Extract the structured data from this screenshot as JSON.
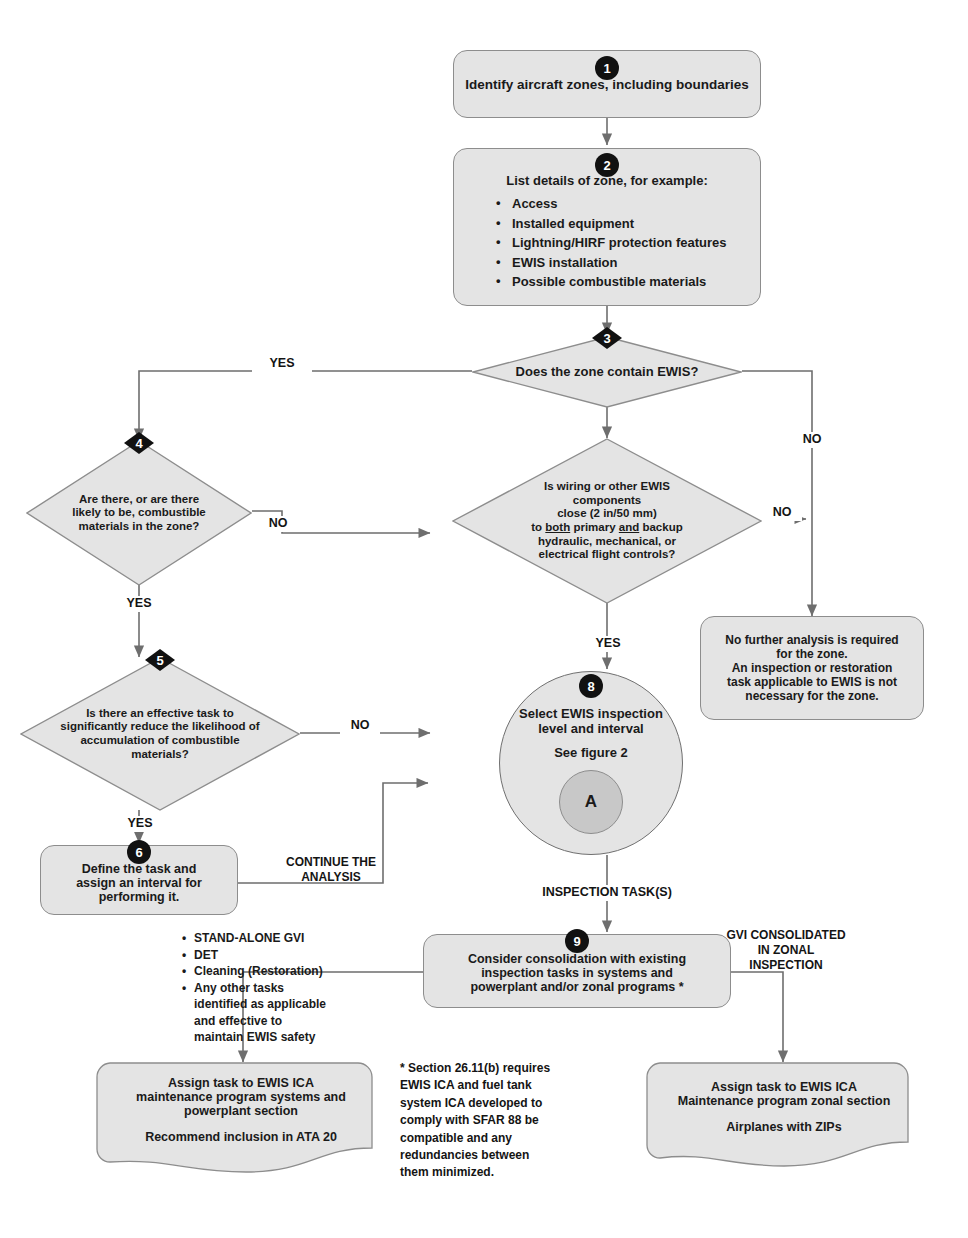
{
  "diagram": {
    "type": "flowchart"
  },
  "nodes": {
    "n1": {
      "badge": "1",
      "text": "Identify aircraft zones, including boundaries"
    },
    "n2": {
      "badge": "2",
      "heading": "List details of zone, for example:",
      "items": [
        "Access",
        "Installed equipment",
        "Lightning/HIRF protection features",
        "EWIS installation",
        "Possible combustible materials"
      ]
    },
    "n3": {
      "badge": "3",
      "text": "Does the zone contain EWIS?"
    },
    "n4": {
      "badge": "4",
      "line1": "Are there, or are there",
      "line2": "likely to be, combustible",
      "line3": "materials in the zone?"
    },
    "n7": {
      "badge": "",
      "line1": "Is wiring or other EWIS",
      "line2": "components",
      "line3": "close (2 in/50 mm)",
      "line4_a": "to ",
      "line4_b": "both",
      "line4_c": " primary ",
      "line4_d": "and",
      "line4_e": " backup",
      "line5": "hydraulic, mechanical, or",
      "line6": "electrical flight controls?"
    },
    "n5": {
      "badge": "5",
      "line1": "Is there an effective task to",
      "line2": "significantly reduce the likelihood of",
      "line3": "accumulation of combustible",
      "line4": "materials?"
    },
    "n6": {
      "badge": "6",
      "line1": "Define the task and",
      "line2": "assign an interval for",
      "line3": "performing it."
    },
    "n8": {
      "badge": "8",
      "line1": "Select EWIS inspection",
      "line2": "level and interval",
      "line3": "See figure 2",
      "sub": "A"
    },
    "n9": {
      "badge": "9",
      "line1": "Consider consolidation with existing",
      "line2": "inspection tasks in systems and",
      "line3": "powerplant and/or zonal programs *"
    },
    "no_further": {
      "line1": "No further analysis is required",
      "line2": "for the zone.",
      "line3": "An inspection or restoration",
      "line4": "task applicable to EWIS is not",
      "line5": "necessary for the zone."
    },
    "assign_systems": {
      "line1": "Assign task to EWIS ICA",
      "line2": "maintenance program systems and",
      "line3": "powerplant section",
      "line4": "Recommend inclusion in ATA 20"
    },
    "assign_zonal": {
      "line1": "Assign task to EWIS ICA",
      "line2": "Maintenance program zonal section",
      "line3": "Airplanes with ZIPs"
    }
  },
  "edge_labels": {
    "yes_3": "YES",
    "no_3": "NO",
    "no_4": "NO",
    "yes_4": "YES",
    "no_7": "NO",
    "yes_7": "YES",
    "no_5": "NO",
    "yes_5": "YES",
    "continue_analysis_1": "CONTINUE THE",
    "continue_analysis_2": "ANALYSIS",
    "inspection_tasks": "INSPECTION TASK(S)",
    "gvi_1": "GVI CONSOLIDATED",
    "gvi_2": "IN ZONAL",
    "gvi_3": "INSPECTION"
  },
  "task_list": {
    "items": [
      {
        "text": "STAND-ALONE GVI",
        "cont": []
      },
      {
        "text": "DET",
        "cont": []
      },
      {
        "text": "Cleaning (Restoration)",
        "cont": []
      },
      {
        "text": "Any other tasks",
        "cont": [
          "identified as applicable",
          "and effective to",
          "maintain EWIS safety"
        ]
      }
    ]
  },
  "footnote": {
    "line1": "* Section 26.11(b) requires",
    "line2": "EWIS ICA and fuel tank",
    "line3": "system ICA developed to",
    "line4": "comply with SFAR 88 be",
    "line5": "compatible and any",
    "line6": "redundancies between",
    "line7": "them minimized."
  },
  "colors": {
    "fill": "#e4e4e4",
    "stroke": "#8d8d8d",
    "badge": "#111111",
    "subcircle": "#c8c8c8",
    "wire": "#6e6e6e"
  }
}
